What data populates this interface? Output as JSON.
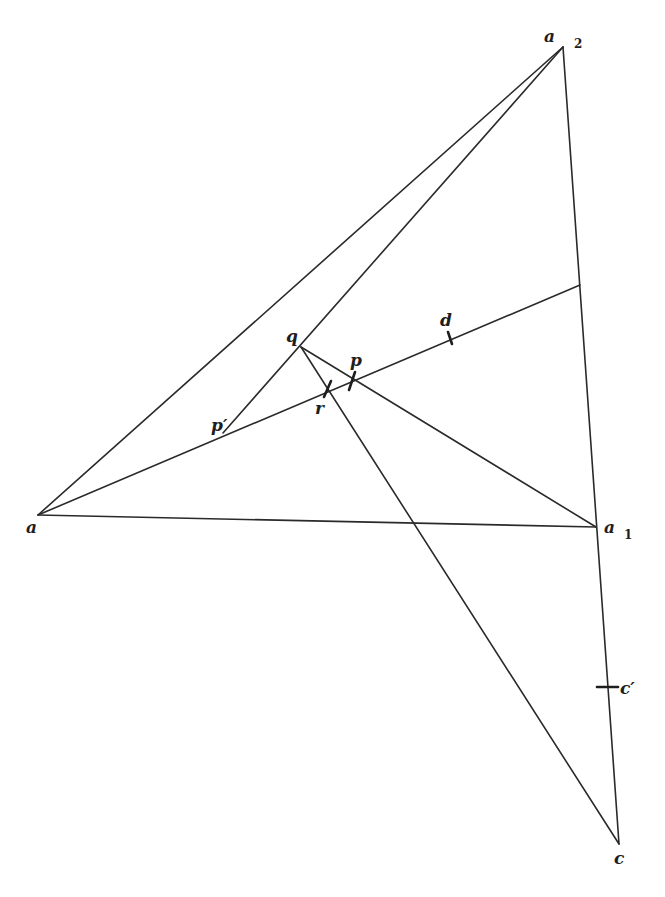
{
  "diagram": {
    "colors": {
      "line": "#2a2a2a",
      "background": "#ffffff"
    },
    "points": {
      "a": {
        "x": 38,
        "y": 515
      },
      "a1": {
        "x": 596,
        "y": 527
      },
      "a2": {
        "x": 563,
        "y": 47
      },
      "c": {
        "x": 619,
        "y": 844
      },
      "q": {
        "x": 301,
        "y": 347
      },
      "p_prime": {
        "x": 223,
        "y": 433
      },
      "e": {
        "x": 580,
        "y": 285
      },
      "r": {
        "x": 327,
        "y": 389
      },
      "p": {
        "x": 352,
        "y": 381
      },
      "d": {
        "x": 450,
        "y": 338
      },
      "c_prime": {
        "x": 607,
        "y": 687
      }
    },
    "segments": [
      [
        "a",
        "a2"
      ],
      [
        "a",
        "a1"
      ],
      [
        "a2",
        "c"
      ],
      [
        "a",
        "e"
      ],
      [
        "a2",
        "p_prime"
      ],
      [
        "q",
        "a1"
      ],
      [
        "q",
        "c"
      ]
    ],
    "labels": {
      "a": {
        "text": "a",
        "sub": ""
      },
      "a1": {
        "text": "a",
        "sub": "1"
      },
      "a2": {
        "text": "a",
        "sub": "2"
      },
      "c": {
        "text": "c",
        "sub": ""
      },
      "c_prime": {
        "text": "c′",
        "sub": ""
      },
      "q": {
        "text": "q",
        "sub": ""
      },
      "p": {
        "text": "p",
        "sub": ""
      },
      "p_prime": {
        "text": "p′",
        "sub": ""
      },
      "r": {
        "text": "r",
        "sub": ""
      },
      "d": {
        "text": "d",
        "sub": ""
      }
    }
  }
}
